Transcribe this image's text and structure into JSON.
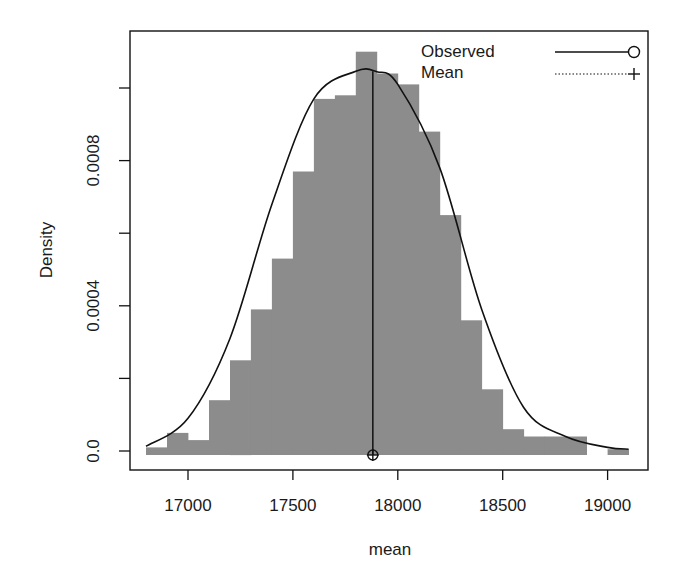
{
  "chart_data": {
    "type": "bar",
    "subtype": "histogram_with_density_curve",
    "title": "",
    "xlabel": "mean",
    "ylabel": "Density",
    "xlim": [
      16700,
      19150
    ],
    "ylim": [
      -5e-05,
      0.00116
    ],
    "x_ticks": [
      17000,
      17500,
      18000,
      18500,
      19000
    ],
    "x_tick_labels": [
      "17000",
      "17500",
      "18000",
      "18500",
      "19000"
    ],
    "y_ticks": [
      0,
      0.0002,
      0.0004,
      0.0006,
      0.0008,
      0.001
    ],
    "y_tick_labels": [
      "0.0",
      "",
      "0.0004",
      "",
      "0.0008",
      ""
    ],
    "grid": false,
    "bin_width": 100,
    "bins_start": [
      16800,
      16900,
      17000,
      17100,
      17200,
      17300,
      17400,
      17500,
      17600,
      17700,
      17800,
      17900,
      18000,
      18100,
      18200,
      18300,
      18400,
      18500,
      18600,
      18700,
      18800,
      18900,
      19000
    ],
    "values": [
      1e-05,
      5e-05,
      3e-05,
      0.00014,
      0.00025,
      0.00039,
      0.00053,
      0.00077,
      0.00097,
      0.00098,
      0.0011,
      0.00104,
      0.00101,
      0.00088,
      0.00065,
      0.00036,
      0.00017,
      6e-05,
      4e-05,
      4e-05,
      4e-05,
      0.0,
      5e-06
    ],
    "series": [
      {
        "name": "Observed",
        "style": "solid",
        "marker": "circle",
        "kind": "density_curve",
        "x": [
          16800,
          17000,
          17200,
          17400,
          17600,
          17800,
          17900,
          18000,
          18200,
          18400,
          18600,
          18800,
          19000,
          19100
        ],
        "y": [
          1.3e-05,
          9e-05,
          0.00031,
          0.00068,
          0.00097,
          0.001046,
          0.001045,
          0.00101,
          0.00078,
          0.00039,
          0.00012,
          4e-05,
          1e-05,
          5e-06
        ]
      },
      {
        "name": "Mean",
        "style": "dotted",
        "marker": "plus",
        "kind": "mean_marker",
        "x": 17881
      }
    ],
    "observed_line_x": 17881,
    "observed_line_top": 0.001046,
    "legend": {
      "position": "top-right",
      "entries": [
        "Observed",
        "Mean"
      ]
    },
    "colors": {
      "bars": "#8c8c8c",
      "curve": "#111111",
      "axes": "#111111",
      "background": "#ffffff"
    }
  },
  "axes": {
    "xlabel": "mean",
    "ylabel": "Density"
  },
  "legend": {
    "observed_label": "Observed",
    "mean_label": "Mean"
  }
}
